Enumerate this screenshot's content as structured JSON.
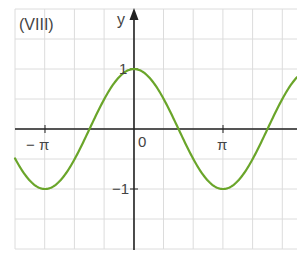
{
  "panel_label": "(VIII)",
  "chart_data": {
    "type": "line",
    "title": "(VIII)",
    "function": "y = cos(x)",
    "xlabel": "",
    "ylabel": "y",
    "x_ticks": [
      {
        "value": -3.14159,
        "label": "− π"
      },
      {
        "value": 0,
        "label": "0"
      },
      {
        "value": 3.14159,
        "label": "π"
      }
    ],
    "y_ticks": [
      {
        "value": 1,
        "label": "1"
      },
      {
        "value": -1,
        "label": "−1"
      }
    ],
    "xlim": [
      -4.2,
      5.7
    ],
    "ylim": [
      -2.0,
      2.0
    ],
    "grid": true,
    "series": [
      {
        "name": "cos x",
        "color": "#6aa52a",
        "x": [
          -4.2,
          -3.14159,
          -1.5708,
          0,
          1.5708,
          3.14159,
          4.7124,
          5.6
        ],
        "values": [
          -0.49,
          -1,
          0,
          1,
          0,
          -1,
          0,
          0.78
        ]
      }
    ]
  },
  "labels": {
    "y_axis": "y",
    "origin": "0",
    "x_neg_pi": "− π",
    "x_pi": "π",
    "y_one": "1",
    "y_neg_one": "−1"
  },
  "colors": {
    "curve": "#6aa52a",
    "axis": "#222222",
    "grid": "#dcdcdc"
  }
}
